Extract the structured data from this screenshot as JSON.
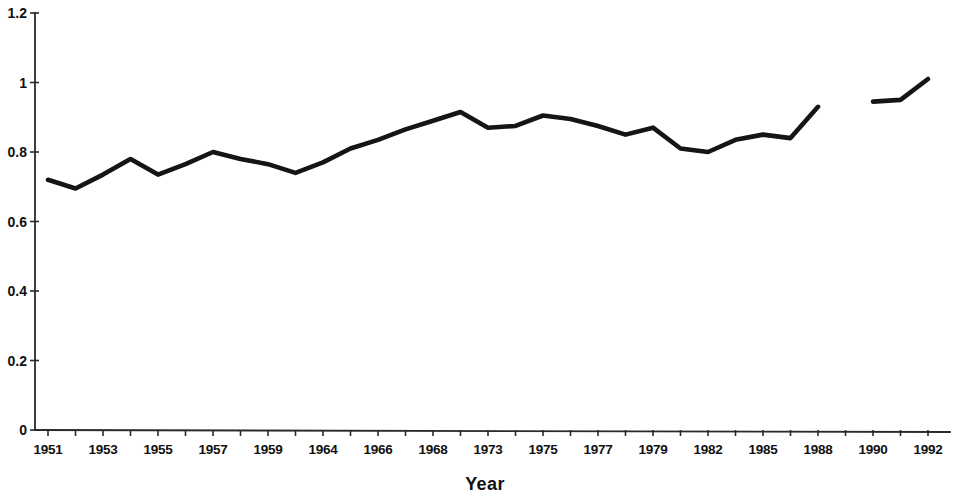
{
  "chart_data": {
    "type": "line",
    "title": "",
    "subtitle": "",
    "xlabel": "Year",
    "ylabel": "",
    "grid": false,
    "legend": false,
    "legend_position": "none",
    "line_color": "#151515",
    "axis_color": "#2a2a2a",
    "background_color": "#ffffff",
    "ylim": [
      0,
      1.2
    ],
    "ytick_labels": [
      "0",
      "0.2",
      "0.4",
      "0.6",
      "0.8",
      "1",
      "1.2"
    ],
    "ytick_values": [
      0,
      0.2,
      0.4,
      0.6,
      0.8,
      1,
      1.2
    ],
    "xtick_labels": [
      "1951",
      "1953",
      "1955",
      "1957",
      "1959",
      "1964",
      "1966",
      "1968",
      "1973",
      "1975",
      "1977",
      "1979",
      "1982",
      "1985",
      "1988",
      "1990",
      "1992"
    ],
    "xtick_label_step": 2,
    "categories": [
      "1951",
      "1952",
      "1953",
      "1954",
      "1955",
      "1956",
      "1957",
      "1958",
      "1959",
      "1963",
      "1964",
      "1965",
      "1966",
      "1967",
      "1968",
      "1972",
      "1973",
      "1974",
      "1975",
      "1976",
      "1977",
      "1978",
      "1979",
      "1981",
      "1982",
      "1984",
      "1985",
      "1987",
      "1988",
      "1989",
      "1990",
      "1991",
      "1992"
    ],
    "values": [
      0.72,
      0.695,
      0.735,
      0.78,
      0.735,
      0.765,
      0.8,
      0.78,
      0.765,
      0.74,
      0.77,
      0.81,
      0.835,
      0.865,
      0.89,
      0.915,
      0.87,
      0.875,
      0.905,
      0.895,
      0.875,
      0.85,
      0.87,
      0.81,
      0.8,
      0.835,
      0.85,
      0.84,
      0.93,
      null,
      0.945,
      0.95,
      1.01
    ],
    "series": [
      {
        "name": "series-1",
        "values": [
          0.72,
          0.695,
          0.735,
          0.78,
          0.735,
          0.765,
          0.8,
          0.78,
          0.765,
          0.74,
          0.77,
          0.81,
          0.835,
          0.865,
          0.89,
          0.915,
          0.87,
          0.875,
          0.905,
          0.895,
          0.875,
          0.85,
          0.87,
          0.81,
          0.8,
          0.835,
          0.85,
          0.84,
          0.93,
          null,
          0.945,
          0.95,
          1.01
        ]
      }
    ],
    "gap_note": "data missing between 1988 and 1990"
  }
}
